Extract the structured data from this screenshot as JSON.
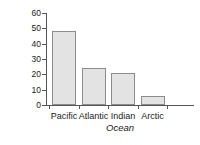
{
  "chart_data": {
    "type": "bar",
    "title": "",
    "subtitle": "",
    "xlabel": "Ocean",
    "ylabel": "Percentage",
    "categories": [
      "Pacific",
      "Atlantic",
      "Indian",
      "Arctic"
    ],
    "values": [
      48,
      24,
      21,
      6
    ],
    "series": [
      {
        "name": "Percentage",
        "values": [
          48,
          24,
          21,
          6
        ]
      }
    ],
    "ylim": [
      0,
      62
    ],
    "yticks": [
      0,
      10,
      20,
      30,
      40,
      50,
      60
    ],
    "ytick_labels": [
      "0",
      "10",
      "20",
      "30",
      "40",
      "50",
      "60"
    ],
    "grid": false,
    "legend": false,
    "legend_position": "none",
    "bar_fill_color": "#e3e3e3",
    "bar_edge_color": "#8c8c8c",
    "axis_color": "#555555",
    "text_color": "#1a1a1a",
    "background_color": "#ffffff",
    "annotations": []
  },
  "axes": {
    "y_title": "Percentage",
    "x_title": "Ocean"
  }
}
